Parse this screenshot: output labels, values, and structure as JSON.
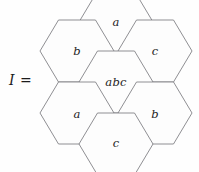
{
  "figure": {
    "equation_label": "I =",
    "background_color": "#fefefe",
    "stroke_color": "#7b7b80",
    "text_color": "#1c1c1c",
    "shape": "hexagon",
    "layout": "honeycomb-7-flat-top",
    "cells": [
      {
        "position": "top",
        "label": "a",
        "cx": 116,
        "cy": 22
      },
      {
        "position": "upper-left",
        "label": "b",
        "cx": 77,
        "cy": 51
      },
      {
        "position": "upper-right",
        "label": "c",
        "cx": 155,
        "cy": 51
      },
      {
        "position": "center",
        "label": "abc",
        "cx": 116,
        "cy": 82
      },
      {
        "position": "lower-left",
        "label": "a",
        "cx": 77,
        "cy": 115
      },
      {
        "position": "lower-right",
        "label": "b",
        "cx": 155,
        "cy": 115
      },
      {
        "position": "bottom",
        "label": "c",
        "cx": 116,
        "cy": 143
      }
    ]
  }
}
